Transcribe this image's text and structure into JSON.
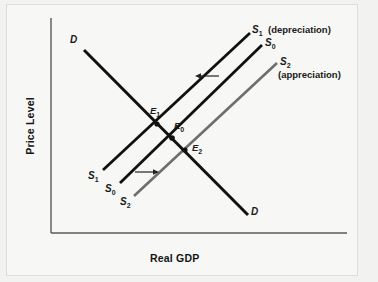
{
  "figure": {
    "domain": "economics-ad-as-diagram",
    "background_color": "#f7f7f5",
    "frame_color": "#dedede"
  },
  "axes": {
    "y_label": "Price Level",
    "x_label": "Real GDP",
    "axis_color": "#4a4a4a",
    "origin": [
      51,
      233
    ],
    "y_top": 18,
    "x_right": 347
  },
  "curves": {
    "demand": {
      "name": "demand-curve",
      "color": "#111111",
      "label_top": "D",
      "label_bottom": "D",
      "x1": 84,
      "y1": 50,
      "x2": 248,
      "y2": 215
    },
    "supply_1": {
      "name": "supply-curve-s1",
      "color": "#111111",
      "label_top": "S",
      "label_top_sub": "1",
      "label_bottom": "S",
      "label_bottom_sub": "1",
      "annotation": "(depreciation)",
      "x1": 103,
      "y1": 170,
      "x2": 250,
      "y2": 33
    },
    "supply_0": {
      "name": "supply-curve-s0",
      "color": "#111111",
      "label_top": "S",
      "label_top_sub": "0",
      "label_bottom": "S",
      "label_bottom_sub": "0",
      "x1": 120,
      "y1": 183,
      "x2": 262,
      "y2": 45
    },
    "supply_2": {
      "name": "supply-curve-s2",
      "color": "#6b6b6b",
      "label_top": "S",
      "label_top_sub": "2",
      "label_bottom": "S",
      "label_bottom_sub": "2",
      "annotation": "(appreciation)",
      "x1": 134,
      "y1": 196,
      "x2": 277,
      "y2": 63
    }
  },
  "equilibria": [
    {
      "name": "E",
      "sub": "1",
      "dot_x": 157,
      "dot_y": 124,
      "label_x": 150,
      "label_y": 107
    },
    {
      "name": "E",
      "sub": "0",
      "dot_x": 172,
      "dot_y": 138,
      "label_x": 174,
      "label_y": 122
    },
    {
      "name": "E",
      "sub": "2",
      "dot_x": 185,
      "dot_y": 150,
      "label_x": 192,
      "label_y": 144
    }
  ],
  "arrows": [
    {
      "name": "shift-arrow-left-depreciation",
      "direction": "left",
      "x_from": 219,
      "x_to": 196,
      "y": 76
    },
    {
      "name": "shift-arrow-right-appreciation",
      "direction": "right",
      "x_from": 135,
      "x_to": 159,
      "y": 172
    }
  ],
  "labels": {
    "demand_top": "D",
    "demand_bottom": "D",
    "s1_letter": "S",
    "s1_sub": "1",
    "s0_letter": "S",
    "s0_sub": "0",
    "s2_letter": "S",
    "s2_sub": "2",
    "depreciation_text": "(depreciation)",
    "appreciation_text": "(appreciation)",
    "e1_letter": "E",
    "e1_sub": "1",
    "e0_letter": "E",
    "e0_sub": "0",
    "e2_letter": "E",
    "e2_sub": "2",
    "y_axis": "Price Level",
    "x_axis": "Real GDP"
  }
}
